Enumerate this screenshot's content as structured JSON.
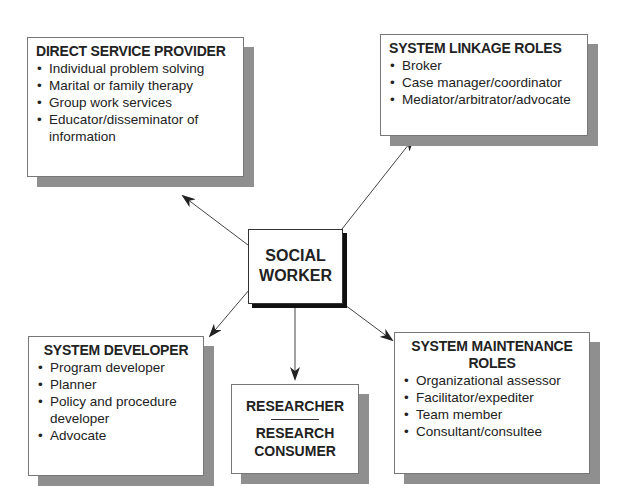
{
  "center": {
    "line1": "SOCIAL",
    "line2": "WORKER"
  },
  "boxes": {
    "direct_service": {
      "title": "DIRECT SERVICE PROVIDER",
      "items": [
        "Individual problem solving",
        "Marital or family therapy",
        "Group work services",
        "Educator/disseminator of information"
      ]
    },
    "system_linkage": {
      "title": "SYSTEM LINKAGE ROLES",
      "items": [
        "Broker",
        "Case manager/coordinator",
        "Mediator/arbitrator/advocate"
      ]
    },
    "system_developer": {
      "title": "SYSTEM DEVELOPER",
      "items": [
        "Program developer",
        "Planner",
        "Policy and procedure developer",
        "Advocate"
      ]
    },
    "researcher": {
      "line1": "RESEARCHER",
      "line2": "RESEARCH",
      "line3": "CONSUMER"
    },
    "system_maintenance": {
      "title_line1": "SYSTEM MAINTENANCE",
      "title_line2": "ROLES",
      "items": [
        "Organizational assessor",
        "Facilitator/expediter",
        "Team member",
        "Consultant/consultee"
      ]
    }
  },
  "colors": {
    "shadow": "#8f8f8f",
    "center_shadow": "#111111",
    "border": "#777777",
    "arrow": "#222222"
  }
}
